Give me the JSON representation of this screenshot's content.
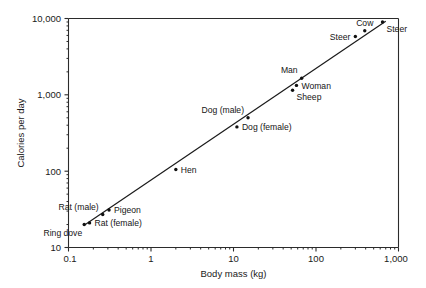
{
  "chart_data": {
    "type": "scatter",
    "title": "",
    "xlabel": "Body mass (kg)",
    "ylabel": "Calories per day",
    "xscale": "log",
    "yscale": "log",
    "xlim": [
      0.1,
      1000
    ],
    "ylim": [
      10,
      10000
    ],
    "grid": false,
    "legend": "none",
    "xticks": [
      "0.1",
      "1",
      "10",
      "100",
      "1,000"
    ],
    "xtick_values": [
      0.1,
      1,
      10,
      100,
      1000
    ],
    "yticks": [
      "10",
      "100",
      "1,000",
      "10,000"
    ],
    "ytick_values": [
      10,
      100,
      1000,
      10000
    ],
    "points": [
      {
        "label": "Ring dove",
        "x": 0.155,
        "y": 20,
        "label_pos": "below-left"
      },
      {
        "label": "Rat (female)",
        "x": 0.18,
        "y": 21,
        "label_pos": "right"
      },
      {
        "label": "Rat (male)",
        "x": 0.26,
        "y": 27,
        "label_pos": "above-left"
      },
      {
        "label": "Pigeon",
        "x": 0.31,
        "y": 31,
        "label_pos": "right"
      },
      {
        "label": "Hen",
        "x": 2.0,
        "y": 105,
        "label_pos": "right"
      },
      {
        "label": "Dog (female)",
        "x": 11,
        "y": 380,
        "label_pos": "right"
      },
      {
        "label": "Dog (male)",
        "x": 15,
        "y": 500,
        "label_pos": "above-left"
      },
      {
        "label": "Sheep",
        "x": 52,
        "y": 1150,
        "label_pos": "below-right"
      },
      {
        "label": "Woman",
        "x": 58,
        "y": 1330,
        "label_pos": "right"
      },
      {
        "label": "Man",
        "x": 67,
        "y": 1650,
        "label_pos": "above-left"
      },
      {
        "label": "Steer",
        "x": 300,
        "y": 5800,
        "label_pos": "left"
      },
      {
        "label": "Cow",
        "x": 390,
        "y": 6900,
        "label_pos": "above"
      },
      {
        "label": "Steer",
        "x": 640,
        "y": 9000,
        "label_pos": "below-right"
      }
    ],
    "fit_line": {
      "description": "allometric regression line",
      "x_start": 0.155,
      "y_start": 19.5,
      "x_end": 700,
      "y_end": 9200
    }
  },
  "colors": {
    "background": "#ffffff",
    "axis": "#2b2b2b",
    "line": "#1a1a1a",
    "marker": "#101010",
    "text": "#1a1a1a"
  }
}
